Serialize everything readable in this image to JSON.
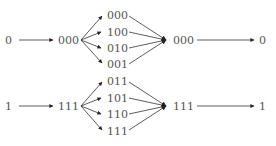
{
  "diagram": {
    "type": "repetition-code encoding/decoding flow",
    "rows": [
      {
        "input": "0",
        "encoded": "000",
        "branches": [
          "000",
          "100",
          "010",
          "001"
        ],
        "decoded": "000",
        "output": "0"
      },
      {
        "input": "1",
        "encoded": "111",
        "branches": [
          "011",
          "101",
          "110",
          "111"
        ],
        "decoded": "111",
        "output": "1"
      }
    ],
    "colors": {
      "text": "#555555",
      "lines": "#333333",
      "arrowheads": "#222222",
      "background": "#ffffff"
    }
  }
}
